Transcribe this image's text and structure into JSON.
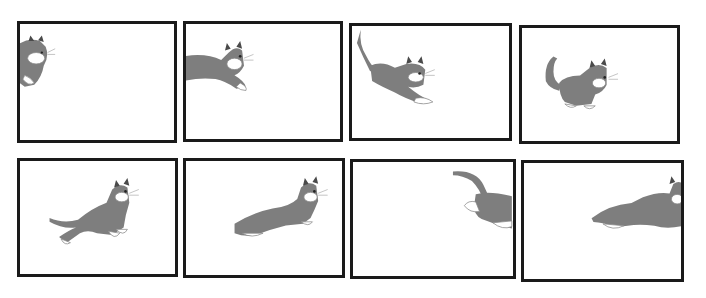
{
  "colors": {
    "border": "#1a1a1a",
    "fur": "#7e7e7e",
    "background": "#ffffff"
  },
  "frames": [
    {
      "index": 1,
      "label": "Cat head and forepaws enter from left edge"
    },
    {
      "index": 2,
      "label": "Cat front half leaping in from left"
    },
    {
      "index": 3,
      "label": "Cat stretched mid-run with tail raised"
    },
    {
      "index": 4,
      "label": "Cat crouched, tail curled up"
    },
    {
      "index": 5,
      "label": "Cat leaping, front paws tucked"
    },
    {
      "index": 6,
      "label": "Cat stretched in full gallop"
    },
    {
      "index": 7,
      "label": "Cat hindquarters and tail exiting right edge"
    },
    {
      "index": 8,
      "label": "Cat stretched, head at right edge"
    }
  ]
}
